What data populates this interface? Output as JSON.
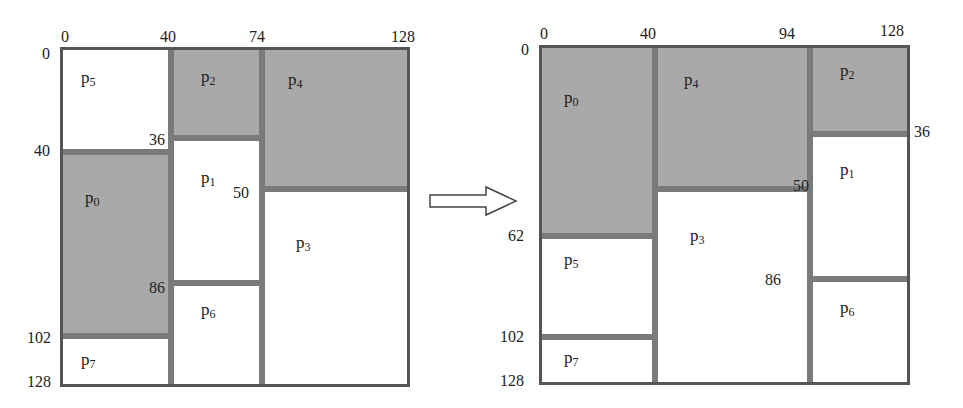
{
  "diagram": {
    "type": "partition-rearrangement",
    "arrow": "right-arrow",
    "colors": {
      "occupied": "#a9a9a9",
      "free": "#ffffff",
      "divider": "#7a7a7a",
      "border": "#555555"
    },
    "left": {
      "x_ticks": [
        "0",
        "40",
        "74",
        "128"
      ],
      "y_ticks": [
        "0",
        "40",
        "102",
        "128"
      ],
      "inner_labels": [
        "36",
        "50",
        "86"
      ],
      "partitions": [
        {
          "name": "p",
          "sub": "5",
          "x0": 0,
          "x1": 40,
          "y0": 0,
          "y1": 40,
          "shaded": false
        },
        {
          "name": "p",
          "sub": "0",
          "x0": 0,
          "x1": 40,
          "y0": 40,
          "y1": 102,
          "shaded": true
        },
        {
          "name": "p",
          "sub": "7",
          "x0": 0,
          "x1": 40,
          "y0": 102,
          "y1": 128,
          "shaded": false
        },
        {
          "name": "p",
          "sub": "2",
          "x0": 40,
          "x1": 74,
          "y0": 0,
          "y1": 36,
          "shaded": true
        },
        {
          "name": "p",
          "sub": "1",
          "x0": 40,
          "x1": 74,
          "y0": 36,
          "y1": 86,
          "shaded": false
        },
        {
          "name": "p",
          "sub": "6",
          "x0": 40,
          "x1": 74,
          "y0": 86,
          "y1": 128,
          "shaded": false
        },
        {
          "name": "p",
          "sub": "4",
          "x0": 74,
          "x1": 128,
          "y0": 0,
          "y1": 50,
          "shaded": true
        },
        {
          "name": "p",
          "sub": "3",
          "x0": 74,
          "x1": 128,
          "y0": 50,
          "y1": 128,
          "shaded": false
        }
      ]
    },
    "right": {
      "x_ticks": [
        "0",
        "40",
        "94",
        "128"
      ],
      "y_ticks": [
        "0",
        "62",
        "102",
        "128"
      ],
      "inner_labels": [
        "36",
        "50",
        "86"
      ],
      "partitions": [
        {
          "name": "p",
          "sub": "0",
          "x0": 0,
          "x1": 40,
          "y0": 0,
          "y1": 62,
          "shaded": true
        },
        {
          "name": "p",
          "sub": "5",
          "x0": 0,
          "x1": 40,
          "y0": 62,
          "y1": 102,
          "shaded": false
        },
        {
          "name": "p",
          "sub": "7",
          "x0": 0,
          "x1": 40,
          "y0": 102,
          "y1": 128,
          "shaded": false
        },
        {
          "name": "p",
          "sub": "4",
          "x0": 40,
          "x1": 94,
          "y0": 0,
          "y1": 50,
          "shaded": true
        },
        {
          "name": "p",
          "sub": "3",
          "x0": 40,
          "x1": 94,
          "y0": 50,
          "y1": 128,
          "shaded": false
        },
        {
          "name": "p",
          "sub": "2",
          "x0": 94,
          "x1": 128,
          "y0": 0,
          "y1": 36,
          "shaded": true
        },
        {
          "name": "p",
          "sub": "1",
          "x0": 94,
          "x1": 128,
          "y0": 36,
          "y1": 86,
          "shaded": false
        },
        {
          "name": "p",
          "sub": "6",
          "x0": 94,
          "x1": 128,
          "y0": 86,
          "y1": 128,
          "shaded": false
        }
      ]
    }
  }
}
